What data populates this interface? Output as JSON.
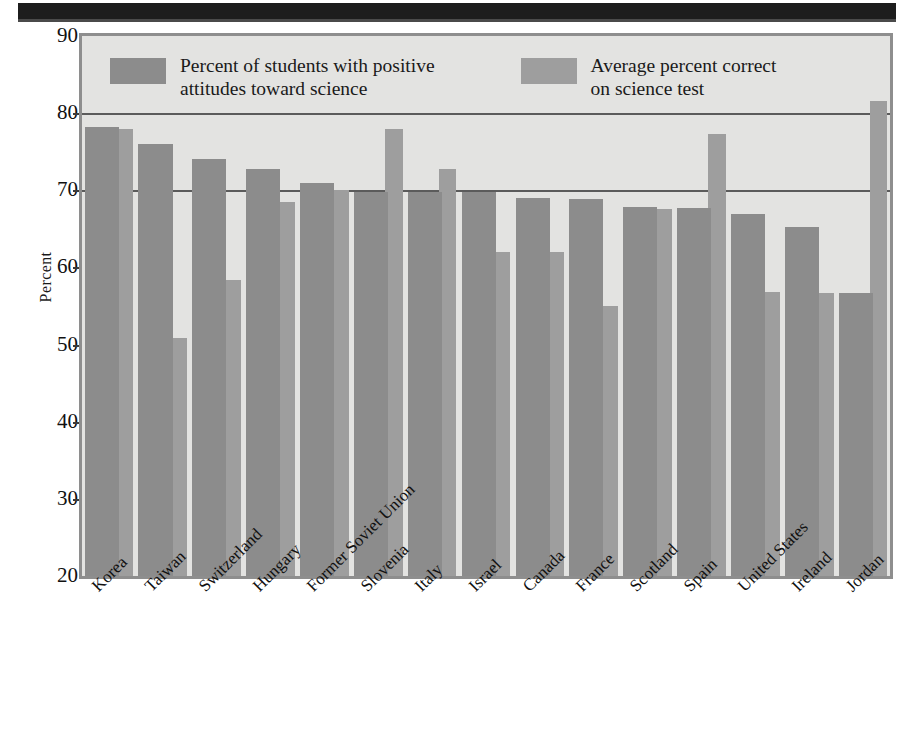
{
  "chart_data": {
    "type": "bar",
    "title": "",
    "xlabel": "",
    "ylabel": "Percent",
    "ylim": [
      20,
      90
    ],
    "yticks": [
      20,
      30,
      40,
      50,
      60,
      70,
      80,
      90
    ],
    "grid": true,
    "legend_position": "top-inside",
    "categories": [
      "Korea",
      "Taiwan",
      "Switzerland",
      "Hungary",
      "Former Soviet Union",
      "Slovenia",
      "Italy",
      "Israel",
      "Canada",
      "France",
      "Scotland",
      "Spain",
      "United States",
      "Ireland",
      "Jordan"
    ],
    "series": [
      {
        "name": "Percent of students with positive attitudes toward science",
        "color": "#8c8c8c",
        "values": [
          78.2,
          76.0,
          74.0,
          72.7,
          71.0,
          69.8,
          69.8,
          69.8,
          69.0,
          68.9,
          67.8,
          67.7,
          66.9,
          65.3,
          56.7
        ]
      },
      {
        "name": "Average percent correct on science test",
        "color": "#9e9e9e",
        "values": [
          78.0,
          50.8,
          58.4,
          68.5,
          70.0,
          78.0,
          72.7,
          62.0,
          62.0,
          55.0,
          67.6,
          77.3,
          56.8,
          56.7,
          81.6
        ]
      }
    ]
  },
  "axis": {
    "y_title": "Percent",
    "y_tick_labels": [
      "90",
      "80",
      "70",
      "60",
      "50",
      "40",
      "30",
      "20"
    ]
  },
  "legend": {
    "items": [
      {
        "label": "Percent of students with positive\nattitudes toward science",
        "swatch": "#8c8c8c"
      },
      {
        "label": "Average percent correct\non science test",
        "swatch": "#9e9e9e"
      }
    ]
  }
}
